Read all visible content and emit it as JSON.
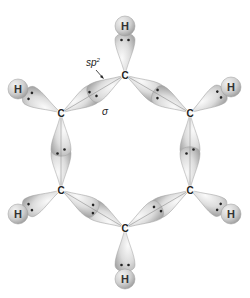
{
  "colors": {
    "lobe_light": "#f4f4f4",
    "lobe_mid": "#d6d6d6",
    "lobe_edge": "#9a9a9a",
    "h_sphere": "#cfcfcf",
    "electron": "#222222",
    "background": "#ffffff"
  },
  "labels": {
    "hybrid": "sp",
    "hybrid_sup": "2",
    "sigma": "σ"
  },
  "atoms": {
    "carbons": [
      {
        "id": "C1",
        "symbol": "C",
        "x": 125,
        "y": 75
      },
      {
        "id": "C2",
        "symbol": "C",
        "x": 190,
        "y": 113
      },
      {
        "id": "C3",
        "symbol": "C",
        "x": 190,
        "y": 190
      },
      {
        "id": "C4",
        "symbol": "C",
        "x": 125,
        "y": 228
      },
      {
        "id": "C5",
        "symbol": "C",
        "x": 61,
        "y": 190
      },
      {
        "id": "C6",
        "symbol": "C",
        "x": 61,
        "y": 113
      }
    ],
    "hydrogens": [
      {
        "id": "H1",
        "symbol": "H",
        "x": 125,
        "y": 26,
        "bonded_to": "C1"
      },
      {
        "id": "H2",
        "symbol": "H",
        "x": 231,
        "y": 87,
        "bonded_to": "C2"
      },
      {
        "id": "H3",
        "symbol": "H",
        "x": 231,
        "y": 214,
        "bonded_to": "C3"
      },
      {
        "id": "H4",
        "symbol": "H",
        "x": 125,
        "y": 279,
        "bonded_to": "C4"
      },
      {
        "id": "H5",
        "symbol": "H",
        "x": 18,
        "y": 214,
        "bonded_to": "C5"
      },
      {
        "id": "H6",
        "symbol": "H",
        "x": 18,
        "y": 89,
        "bonded_to": "C6"
      }
    ]
  },
  "bonds": [
    {
      "type": "C-C sigma",
      "from": "C1",
      "to": "C2"
    },
    {
      "type": "C-C sigma",
      "from": "C2",
      "to": "C3"
    },
    {
      "type": "C-C sigma",
      "from": "C3",
      "to": "C4"
    },
    {
      "type": "C-C sigma",
      "from": "C4",
      "to": "C5"
    },
    {
      "type": "C-C sigma",
      "from": "C5",
      "to": "C6"
    },
    {
      "type": "C-C sigma",
      "from": "C6",
      "to": "C1"
    },
    {
      "type": "C-H sigma",
      "from": "C1",
      "to": "H1"
    },
    {
      "type": "C-H sigma",
      "from": "C2",
      "to": "H2"
    },
    {
      "type": "C-H sigma",
      "from": "C3",
      "to": "H3"
    },
    {
      "type": "C-H sigma",
      "from": "C4",
      "to": "H4"
    },
    {
      "type": "C-H sigma",
      "from": "C5",
      "to": "H5"
    },
    {
      "type": "C-H sigma",
      "from": "C6",
      "to": "H6"
    }
  ],
  "annotations": [
    {
      "text": "sp2",
      "x": 93,
      "y": 64,
      "arrow_to": [
        104,
        78
      ]
    },
    {
      "text": "σ",
      "x": 102,
      "y": 112
    }
  ]
}
